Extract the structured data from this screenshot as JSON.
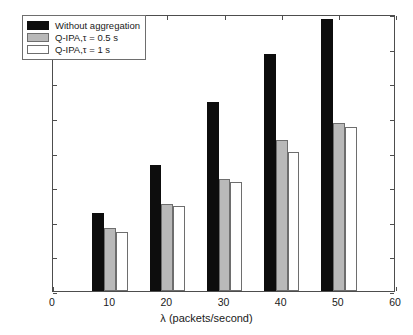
{
  "chart_data": {
    "type": "bar",
    "title": "",
    "xlabel": "λ (packets/second)",
    "ylabel": "Energ consumption (J/s)",
    "categories": [
      10,
      20,
      30,
      40,
      50
    ],
    "series": [
      {
        "name": "Without aggregation",
        "color": "#0d0d0d",
        "values": [
          0.045,
          0.073,
          0.109,
          0.137,
          0.157
        ]
      },
      {
        "name": "Q-IPA,τ = 0.5 s",
        "color": "#b9b9b9",
        "values": [
          0.0365,
          0.0505,
          0.0645,
          0.087,
          0.097
        ]
      },
      {
        "name": "Q-IPA,τ = 1 s",
        "color": "#ffffff",
        "values": [
          0.034,
          0.0493,
          0.063,
          0.0805,
          0.095
        ]
      }
    ],
    "xlim": [
      0,
      60
    ],
    "ylim": [
      0,
      0.16
    ],
    "xticks": [
      0,
      10,
      20,
      30,
      40,
      50,
      60
    ],
    "xtick_labels": [
      "0",
      "10",
      "20",
      "30",
      "40",
      "50",
      "60"
    ],
    "yticks": [
      0,
      0.02,
      0.04,
      0.06,
      0.08,
      0.1,
      0.12,
      0.14,
      0.16
    ],
    "ytick_labels": [
      "0",
      "0.02",
      "0.04",
      "0.06",
      "0.08",
      "0.1",
      "0.12",
      "0.14",
      "0.16"
    ],
    "grid": false,
    "legend_position": "upper left"
  }
}
